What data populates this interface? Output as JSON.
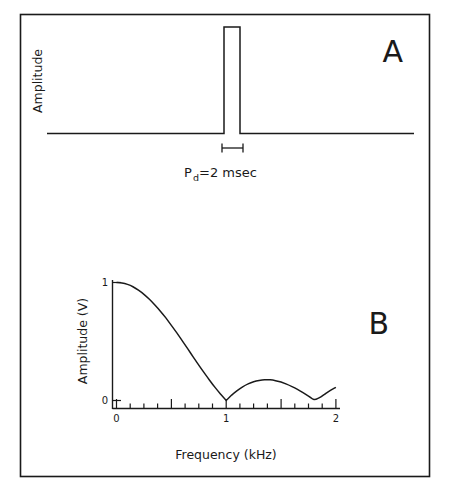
{
  "figure": {
    "background_color": "#ffffff",
    "ink_color": "#1a1a1a",
    "border": {
      "name": "figure-border"
    }
  },
  "panels": [
    {
      "id": "A",
      "letter": "A",
      "ylabel": "Amplitude",
      "annotation": {
        "prefix": "P",
        "subscript": "d",
        "suffix": "=2 msec",
        "full_text": "Pd=2 msec"
      },
      "waveform": {
        "type": "rectangular-pulse",
        "pulse_duration_msec": 2,
        "baseline_value": 0,
        "pulse_amplitude": 1
      }
    },
    {
      "id": "B",
      "letter": "B",
      "ylabel": "Amplitude (V)",
      "xlabel": "Frequency (kHz)",
      "ytick_labels": [
        "0",
        "1"
      ],
      "xtick_labels": [
        "0",
        "1",
        "2"
      ]
    }
  ],
  "chart_data": {
    "type": "line",
    "title": "",
    "subtitle": "",
    "xlabel": "Frequency (kHz)",
    "ylabel": "Amplitude (V)",
    "xlim": [
      0,
      2
    ],
    "ylim": [
      0,
      1
    ],
    "xticks": [
      0,
      1,
      2
    ],
    "xticks_minor_step": 0.125,
    "yticks": [
      0,
      1
    ],
    "grid": false,
    "legend": null,
    "series": [
      {
        "name": "Magnitude spectrum |sinc(pi f Pd)|",
        "description": "Rectified sinc envelope of a 2 msec rectangular pulse; nulls at multiples of 0.5 kHz",
        "x": [
          0.0,
          0.05,
          0.1,
          0.15,
          0.2,
          0.25,
          0.3,
          0.35,
          0.4,
          0.45,
          0.5,
          0.55,
          0.6,
          0.65,
          0.7,
          0.75,
          0.8,
          0.85,
          0.9,
          0.95,
          1.0,
          1.05,
          1.1,
          1.15,
          1.2,
          1.25,
          1.3,
          1.35,
          1.4,
          1.45,
          1.5,
          1.55,
          1.6,
          1.65,
          1.7,
          1.75,
          1.8,
          1.85,
          1.9,
          1.95,
          2.0
        ],
        "y": [
          1.0,
          0.996,
          0.984,
          0.964,
          0.935,
          0.9,
          0.858,
          0.809,
          0.757,
          0.7,
          0.637,
          0.573,
          0.505,
          0.437,
          0.368,
          0.3,
          0.234,
          0.17,
          0.109,
          0.053,
          0.0,
          0.046,
          0.084,
          0.116,
          0.141,
          0.159,
          0.17,
          0.176,
          0.175,
          0.168,
          0.156,
          0.139,
          0.118,
          0.094,
          0.067,
          0.038,
          0.008,
          0.024,
          0.055,
          0.085,
          0.112
        ],
        "nulls": [
          0.5,
          1.0,
          1.5
        ],
        "sidelobe_peaks": [
          {
            "x": 0.72,
            "y": 0.217
          },
          {
            "x": 1.22,
            "y": 0.128
          },
          {
            "x": 1.73,
            "y": 0.091
          }
        ],
        "main_lobe_peak": {
          "x": 0.0,
          "y": 1.0
        }
      }
    ]
  }
}
